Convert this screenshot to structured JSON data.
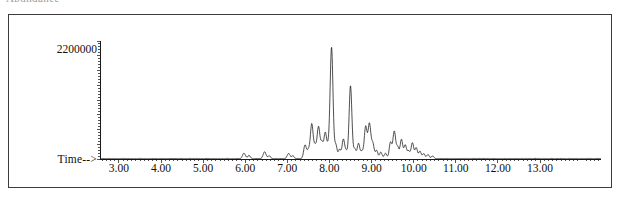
{
  "caption": {
    "clipped_text_fragment": "Abundance"
  },
  "chart_data": {
    "type": "line",
    "title": "",
    "subtitle": "",
    "xlabel": "Time-->",
    "ylabel": "",
    "y_axis_label_value": "2200000",
    "grid": false,
    "legend": false,
    "legend_position": "none",
    "xlim": [
      2.55,
      14.45
    ],
    "ylim": [
      0,
      2600000
    ],
    "x_tick_labels": [
      "3.00",
      "4.00",
      "5.00",
      "6.00",
      "7.00",
      "8.00",
      "9.00",
      "10.00",
      "11.00",
      "12.00",
      "13.00"
    ],
    "x_tick_values": [
      3,
      4,
      5,
      6,
      7,
      8,
      9,
      10,
      11,
      12,
      13
    ],
    "y_tick_labels": [
      "2200000"
    ],
    "y_tick_values": [
      2200000
    ],
    "series": [
      {
        "name": "Total Ion Chromatogram",
        "color": "#141414",
        "peaks": [
          {
            "time": 5.97,
            "height": 120000,
            "width": 0.035
          },
          {
            "time": 6.09,
            "height": 70000,
            "width": 0.03
          },
          {
            "time": 6.46,
            "height": 150000,
            "width": 0.035
          },
          {
            "time": 6.57,
            "height": 60000,
            "width": 0.03
          },
          {
            "time": 7.03,
            "height": 110000,
            "width": 0.035
          },
          {
            "time": 7.13,
            "height": 60000,
            "width": 0.03
          },
          {
            "time": 7.42,
            "height": 300000,
            "width": 0.032
          },
          {
            "time": 7.5,
            "height": 180000,
            "width": 0.03
          },
          {
            "time": 7.58,
            "height": 760000,
            "width": 0.033
          },
          {
            "time": 7.66,
            "height": 260000,
            "width": 0.03
          },
          {
            "time": 7.74,
            "height": 700000,
            "width": 0.033
          },
          {
            "time": 7.82,
            "height": 340000,
            "width": 0.03
          },
          {
            "time": 7.9,
            "height": 560000,
            "width": 0.032
          },
          {
            "time": 7.97,
            "height": 230000,
            "width": 0.03
          },
          {
            "time": 8.05,
            "height": 2450000,
            "width": 0.034
          },
          {
            "time": 8.15,
            "height": 300000,
            "width": 0.03
          },
          {
            "time": 8.24,
            "height": 200000,
            "width": 0.03
          },
          {
            "time": 8.33,
            "height": 420000,
            "width": 0.031
          },
          {
            "time": 8.4,
            "height": 150000,
            "width": 0.03
          },
          {
            "time": 8.5,
            "height": 1600000,
            "width": 0.033
          },
          {
            "time": 8.6,
            "height": 210000,
            "width": 0.03
          },
          {
            "time": 8.69,
            "height": 330000,
            "width": 0.031
          },
          {
            "time": 8.77,
            "height": 150000,
            "width": 0.03
          },
          {
            "time": 8.86,
            "height": 700000,
            "width": 0.033
          },
          {
            "time": 8.95,
            "height": 760000,
            "width": 0.033
          },
          {
            "time": 9.03,
            "height": 330000,
            "width": 0.031
          },
          {
            "time": 9.12,
            "height": 180000,
            "width": 0.03
          },
          {
            "time": 9.22,
            "height": 140000,
            "width": 0.03
          },
          {
            "time": 9.33,
            "height": 120000,
            "width": 0.03
          },
          {
            "time": 9.45,
            "height": 360000,
            "width": 0.031
          },
          {
            "time": 9.54,
            "height": 600000,
            "width": 0.032
          },
          {
            "time": 9.62,
            "height": 250000,
            "width": 0.03
          },
          {
            "time": 9.71,
            "height": 420000,
            "width": 0.031
          },
          {
            "time": 9.8,
            "height": 300000,
            "width": 0.03
          },
          {
            "time": 9.88,
            "height": 170000,
            "width": 0.03
          },
          {
            "time": 9.97,
            "height": 350000,
            "width": 0.031
          },
          {
            "time": 10.06,
            "height": 240000,
            "width": 0.03
          },
          {
            "time": 10.15,
            "height": 160000,
            "width": 0.03
          },
          {
            "time": 10.24,
            "height": 110000,
            "width": 0.03
          },
          {
            "time": 10.34,
            "height": 90000,
            "width": 0.03
          },
          {
            "time": 10.45,
            "height": 60000,
            "width": 0.03
          }
        ],
        "baseline": 8000,
        "noise_amplitude": 5000
      }
    ]
  }
}
